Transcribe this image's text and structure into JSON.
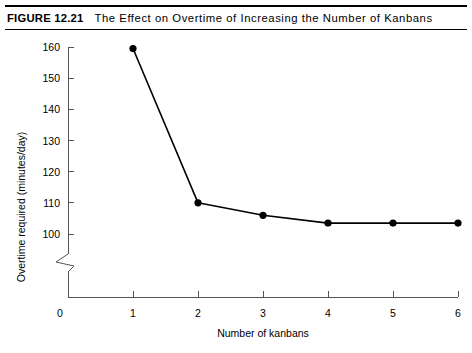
{
  "figure": {
    "number_label": "FIGURE 12.21",
    "title": "The Effect on Overtime of Increasing the Number of Kanbans"
  },
  "chart_data": {
    "type": "line",
    "title": "The Effect on Overtime of Increasing the Number of Kanbans",
    "xlabel": "Number of kanbans",
    "ylabel": "Overtime required (minutes/day)",
    "x": [
      1,
      2,
      3,
      4,
      5,
      6
    ],
    "values": [
      159.5,
      110,
      106,
      103.5,
      103.5,
      103.5
    ],
    "series": [
      {
        "name": "Overtime required",
        "values": [
          159.5,
          110,
          106,
          103.5,
          103.5,
          103.5
        ]
      }
    ],
    "xlim": [
      0,
      6
    ],
    "ylim": [
      100,
      160
    ],
    "xticks": [
      "0",
      "1",
      "2",
      "3",
      "4",
      "5",
      "6"
    ],
    "yticks": [
      "100",
      "110",
      "120",
      "130",
      "140",
      "150",
      "160"
    ],
    "y_axis_break": true,
    "y_axis_break_label": "0",
    "grid": false,
    "legend": false,
    "marker": "filled-circle",
    "line_color": "#000000",
    "marker_color": "#000000",
    "axis_color": "#555555"
  }
}
